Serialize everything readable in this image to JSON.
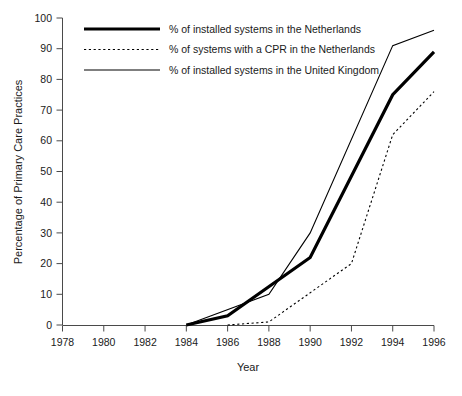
{
  "chart_data": {
    "type": "line",
    "title": "",
    "subtitle": "",
    "xlabel": "Year",
    "ylabel": "Percentage of Primary Care Practices",
    "xlim": [
      1978,
      1996
    ],
    "ylim": [
      0,
      100
    ],
    "grid": false,
    "legend_position": "top-left",
    "xticks": [
      1978,
      1980,
      1982,
      1984,
      1986,
      1988,
      1990,
      1992,
      1994,
      1996
    ],
    "xtick_labels": [
      "1978",
      "1980",
      "1982",
      "1984",
      "1986",
      "1988",
      "1990",
      "1992",
      "1994",
      "1996"
    ],
    "yticks": [
      0,
      10,
      20,
      30,
      40,
      50,
      60,
      70,
      80,
      90,
      100
    ],
    "ytick_labels": [
      "0",
      "10",
      "20",
      "30",
      "40",
      "50",
      "60",
      "70",
      "80",
      "90",
      "100"
    ],
    "series": [
      {
        "name": "% of installed systems in the Netherlands",
        "style": "solid-thick",
        "color": "#000000",
        "linewidth": 3.2,
        "x": [
          1984,
          1986,
          1990,
          1994,
          1996
        ],
        "values": [
          0,
          3,
          22,
          75,
          89
        ]
      },
      {
        "name": "% of systems with a CPR in the Netherlands",
        "style": "dotted",
        "color": "#000000",
        "linewidth": 1.1,
        "x": [
          1986,
          1988,
          1992,
          1994,
          1996
        ],
        "values": [
          0,
          1,
          20,
          62,
          76
        ]
      },
      {
        "name": "% of installed systems in the United Kingdom",
        "style": "solid-thin",
        "color": "#000000",
        "linewidth": 1.1,
        "x": [
          1984,
          1988,
          1990,
          1994,
          1996
        ],
        "values": [
          0,
          10,
          30,
          91,
          96
        ]
      }
    ]
  },
  "legend": {
    "entries": [
      {
        "label": "% of installed systems in the Netherlands",
        "style": "solid-thick"
      },
      {
        "label": "% of systems with a CPR in the Netherlands",
        "style": "dotted"
      },
      {
        "label": "% of installed systems in the United Kingdom",
        "style": "solid-thin"
      }
    ]
  },
  "axes": {
    "x_title": "Year",
    "y_title": "Percentage of Primary Care Practices"
  }
}
